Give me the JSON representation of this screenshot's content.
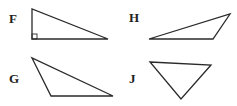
{
  "figure": {
    "type": "triangles-multiple-choice",
    "colors": {
      "stroke": "#2a2a2a",
      "label": "#222222",
      "background": "#ffffff"
    },
    "shapes": [
      {
        "label": "F",
        "kind": "right triangle",
        "label_pos": [
          9,
          23
        ],
        "points": [
          [
            32,
            9
          ],
          [
            32,
            39
          ],
          [
            108,
            39
          ]
        ],
        "right_angle_marker": true
      },
      {
        "label": "H",
        "kind": "obtuse triangle",
        "label_pos": [
          129,
          22
        ],
        "points": [
          [
            149,
            39
          ],
          [
            213,
            39
          ],
          [
            230,
            14
          ]
        ],
        "right_angle_marker": false
      },
      {
        "label": "G",
        "kind": "obtuse triangle",
        "label_pos": [
          9,
          83
        ],
        "points": [
          [
            32,
            58
          ],
          [
            51,
            96
          ],
          [
            113,
            96
          ]
        ],
        "right_angle_marker": false
      },
      {
        "label": "J",
        "kind": "acute triangle",
        "label_pos": [
          129,
          83
        ],
        "points": [
          [
            150,
            62
          ],
          [
            211,
            65
          ],
          [
            181,
            99
          ]
        ],
        "right_angle_marker": false
      }
    ]
  }
}
